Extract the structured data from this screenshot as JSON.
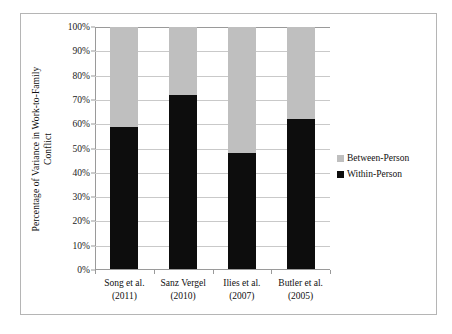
{
  "chart_data": {
    "type": "bar",
    "subtype": "stacked-100-percent",
    "title": "",
    "xlabel": "",
    "ylabel": "Percentage of Variance in Work-to-Family Conflict",
    "ylabel_lines": [
      "Percentage of Variance in Work-to-Family",
      "Conflict"
    ],
    "ylim": [
      0,
      100
    ],
    "yticks": [
      0,
      10,
      20,
      30,
      40,
      50,
      60,
      70,
      80,
      90,
      100
    ],
    "ytick_labels": [
      "0%",
      "10%",
      "20%",
      "30%",
      "40%",
      "50%",
      "60%",
      "70%",
      "80%",
      "90%",
      "100%"
    ],
    "grid": true,
    "legend_position": "right",
    "categories": [
      "Song et al. (2011)",
      "Sanz Vergel (2010)",
      "Ilies et al. (2007)",
      "Butler et al. (2005)"
    ],
    "category_lines": [
      [
        "Song et al.",
        "(2011)"
      ],
      [
        "Sanz Vergel",
        "(2010)"
      ],
      [
        "Ilies et al.",
        "(2007)"
      ],
      [
        "Butler et al.",
        "(2005)"
      ]
    ],
    "series": [
      {
        "name": "Within-Person",
        "color": "#0d0d0d",
        "values": [
          59,
          72,
          48,
          62
        ]
      },
      {
        "name": "Between-Person",
        "color": "#bfbfbf",
        "values": [
          41,
          28,
          52,
          38
        ]
      }
    ]
  },
  "legend": {
    "items": [
      {
        "label": "Between-Person",
        "color": "#bfbfbf"
      },
      {
        "label": "Within-Person",
        "color": "#0d0d0d"
      }
    ]
  },
  "style": {
    "frame_color": "#b5b5b5",
    "axis_color": "#9a9a9a",
    "gridline_color": "#c9c9c9",
    "background": "#ffffff",
    "text_color": "#101010"
  }
}
